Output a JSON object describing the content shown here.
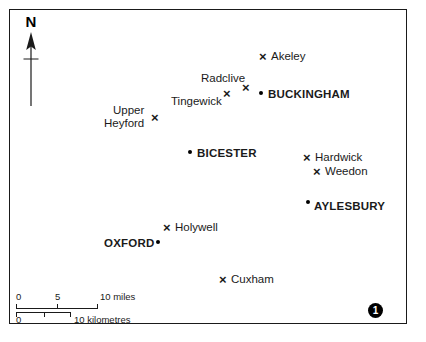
{
  "figure": {
    "badge_number": "1",
    "frame_color": "#1a1a1a",
    "background_color": "#ffffff"
  },
  "north_arrow": {
    "label": "N",
    "icon": "north-arrow-icon"
  },
  "places": [
    {
      "id": "akeley",
      "name": "Akeley",
      "type": "village",
      "marker": "cross",
      "label_position": "right",
      "marker_x": 263,
      "marker_y": 57,
      "label_x": 271,
      "label_y": 50
    },
    {
      "id": "radclive",
      "name": "Radclive",
      "type": "village",
      "marker": "cross",
      "label_position": "above",
      "marker_x": 246,
      "marker_y": 88,
      "label_x": 201,
      "label_y": 72
    },
    {
      "id": "tingewick",
      "name": "Tingewick",
      "type": "village",
      "marker": "cross",
      "label_position": "left",
      "marker_x": 227,
      "marker_y": 94,
      "label_x": 171,
      "label_y": 95
    },
    {
      "id": "buckingham",
      "name": "BUCKINGHAM",
      "type": "town",
      "marker": "dot",
      "label_position": "right",
      "marker_x": 261,
      "marker_y": 93,
      "label_x": 268,
      "label_y": 88
    },
    {
      "id": "upper-heyford",
      "name": "Upper Heyford",
      "name_line1": "Upper",
      "name_line2": "Heyford",
      "type": "village",
      "marker": "cross",
      "label_position": "left-two-line",
      "marker_x": 155,
      "marker_y": 118,
      "label_x": 104,
      "label_y": 104
    },
    {
      "id": "bicester",
      "name": "BICESTER",
      "type": "town",
      "marker": "dot",
      "label_position": "right",
      "marker_x": 190,
      "marker_y": 152,
      "label_x": 197,
      "label_y": 147
    },
    {
      "id": "hardwick",
      "name": "Hardwick",
      "type": "village",
      "marker": "cross",
      "label_position": "right",
      "marker_x": 307,
      "marker_y": 158,
      "label_x": 315,
      "label_y": 151
    },
    {
      "id": "weedon",
      "name": "Weedon",
      "type": "village",
      "marker": "cross",
      "label_position": "right",
      "marker_x": 317,
      "marker_y": 172,
      "label_x": 325,
      "label_y": 165
    },
    {
      "id": "aylesbury",
      "name": "AYLESBURY",
      "type": "town",
      "marker": "dot",
      "label_position": "right",
      "marker_x": 308,
      "marker_y": 202,
      "label_x": 314,
      "label_y": 200
    },
    {
      "id": "holywell",
      "name": "Holywell",
      "type": "village",
      "marker": "cross",
      "label_position": "right",
      "marker_x": 167,
      "marker_y": 228,
      "label_x": 175,
      "label_y": 221
    },
    {
      "id": "oxford",
      "name": "OXFORD",
      "type": "town",
      "marker": "dot",
      "label_position": "left",
      "marker_x": 158,
      "marker_y": 242,
      "label_x": 104,
      "label_y": 237
    },
    {
      "id": "cuxham",
      "name": "Cuxham",
      "type": "village",
      "marker": "cross",
      "label_position": "right",
      "marker_x": 223,
      "marker_y": 280,
      "label_x": 231,
      "label_y": 273
    }
  ],
  "scale": {
    "miles": {
      "unit_label": "10 miles",
      "start_label": "0",
      "mid_label": "5",
      "bar_left": 16,
      "bar_width": 82,
      "mid_tick_fraction": 0.5
    },
    "kilometres": {
      "unit_label": "10 kilometres",
      "start_label": "0",
      "bar_left": 16,
      "bar_width": 55,
      "mid_tick_fraction": 0.5
    }
  }
}
